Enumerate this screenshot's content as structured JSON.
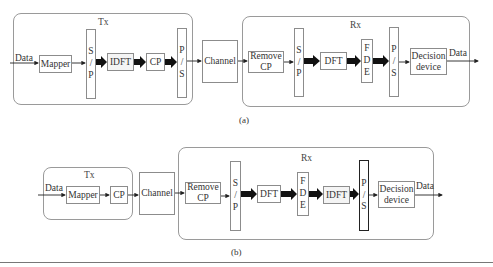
{
  "diagram_a": {
    "caption": "(a)",
    "tx": {
      "title": "Tx",
      "input_label": "Data",
      "blocks": [
        "Mapper",
        "S / P",
        "IDFT",
        "CP",
        "P / S"
      ]
    },
    "channel": "Channel",
    "rx": {
      "title": "Rx",
      "output_label": "Data",
      "blocks": [
        "Remove CP",
        "S / P",
        "DFT",
        "F D E",
        "P / S",
        "Decision device"
      ]
    }
  },
  "diagram_b": {
    "caption": "(b)",
    "tx": {
      "title": "Tx",
      "input_label": "Data",
      "blocks": [
        "Mapper",
        "CP"
      ]
    },
    "channel": "Channel",
    "rx": {
      "title": "Rx",
      "output_label": "Data",
      "blocks": [
        "Remove CP",
        "S / P",
        "DFT",
        "F D E",
        "IDFT",
        "P / S",
        "Decision device"
      ]
    }
  },
  "text": {
    "data": "Data",
    "tx": "Tx",
    "rx": "Rx",
    "mapper": "Mapper",
    "idft": "IDFT",
    "dft": "DFT",
    "cp": "CP",
    "channel": "Channel",
    "remove": "Remove",
    "s": "S",
    "p": "P",
    "slash": "/",
    "f": "F",
    "d": "D",
    "e": "E",
    "decision": "Decision",
    "device": "device",
    "cap_a": "(a)",
    "cap_b": "(b)"
  }
}
